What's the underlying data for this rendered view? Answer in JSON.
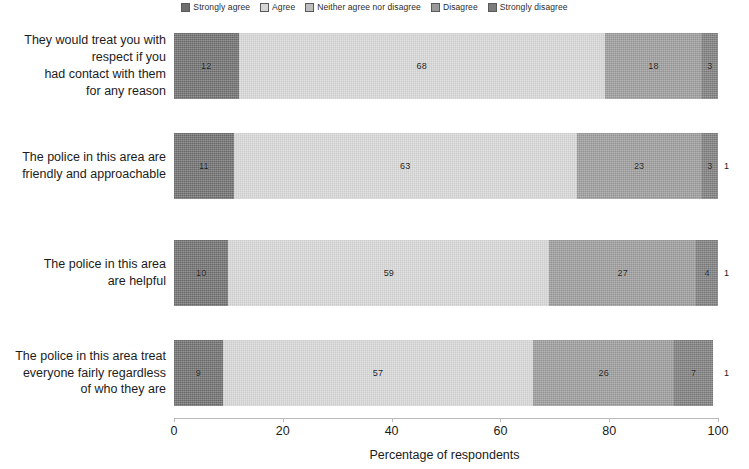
{
  "legend": {
    "position": "top-center",
    "items": [
      {
        "label": "Strongly agree",
        "color": "#6e6e6e"
      },
      {
        "label": "Agree",
        "color": "#d6d6d6"
      },
      {
        "label": "Neither agree nor disagree",
        "color": "#bdbdbd"
      },
      {
        "label": "Disagree",
        "color": "#9a9a9a"
      },
      {
        "label": "Strongly disagree",
        "color": "#7c7c7c"
      }
    ]
  },
  "axis": {
    "x_title": "Percentage of respondents",
    "x_ticks": [
      "0",
      "20",
      "40",
      "60",
      "80",
      "100"
    ]
  },
  "categories": [
    {
      "lines": [
        "They would treat you with",
        "respect if  you",
        "had contact with them",
        "for any reason"
      ]
    },
    {
      "lines": [
        "The police in this area are",
        "friendly and approachable"
      ]
    },
    {
      "lines": [
        "The police in this area",
        "are helpful"
      ]
    },
    {
      "lines": [
        "The police in this area treat",
        "everyone fairly regardless",
        "of who they are"
      ]
    }
  ],
  "chart_data": {
    "type": "bar",
    "orientation": "horizontal",
    "stacked": true,
    "title": "",
    "xlabel": "Percentage of respondents",
    "ylabel": "",
    "xlim": [
      0,
      100
    ],
    "xticks": [
      0,
      20,
      40,
      60,
      80,
      100
    ],
    "grid": false,
    "legend_position": "top-center",
    "categories": [
      "They would treat you with respect if  you had contact with them for any reason",
      "The police in this area are friendly and approachable",
      "The police in this area are helpful",
      "The police in this area treat everyone fairly regardless of who they are"
    ],
    "series": [
      {
        "name": "Strongly agree",
        "color": "#6e6e6e",
        "values": [
          12,
          11,
          10,
          9
        ]
      },
      {
        "name": "Agree",
        "color": "#d6d6d6",
        "values": [
          68,
          63,
          59,
          57
        ]
      },
      {
        "name": "Neither agree nor disagree",
        "color": "#bdbdbd",
        "values": [
          0,
          0,
          0,
          0
        ]
      },
      {
        "name": "Disagree",
        "color": "#9a9a9a",
        "values": [
          18,
          23,
          27,
          26
        ]
      },
      {
        "name": "Strongly disagree",
        "color": "#7c7c7c",
        "values": [
          3,
          3,
          4,
          7
        ]
      }
    ],
    "bars": [
      {
        "category_index": 0,
        "segments": [
          {
            "series": "Strongly agree",
            "value": 12,
            "label": "12",
            "color": "#6e6e6e",
            "label_inside": true
          },
          {
            "series": "Agree",
            "value": 68,
            "label": "68",
            "color": "#d6d6d6",
            "label_inside": true
          },
          {
            "series": "Neither agree nor disagree",
            "value": 0,
            "label": "",
            "color": "#bdbdbd",
            "label_inside": true
          },
          {
            "series": "Disagree",
            "value": 18,
            "label": "18",
            "color": "#9a9a9a",
            "label_inside": true
          },
          {
            "series": "Strongly disagree",
            "value": 3,
            "label": "3",
            "color": "#7c7c7c",
            "label_inside": true
          }
        ],
        "trailing_label": ""
      },
      {
        "category_index": 1,
        "segments": [
          {
            "series": "Strongly agree",
            "value": 11,
            "label": "11",
            "color": "#6e6e6e",
            "label_inside": true
          },
          {
            "series": "Agree",
            "value": 63,
            "label": "63",
            "color": "#d6d6d6",
            "label_inside": true
          },
          {
            "series": "Neither agree nor disagree",
            "value": 0,
            "label": "",
            "color": "#bdbdbd",
            "label_inside": true
          },
          {
            "series": "Disagree",
            "value": 23,
            "label": "23",
            "color": "#9a9a9a",
            "label_inside": true
          },
          {
            "series": "Strongly disagree",
            "value": 3,
            "label": "3",
            "color": "#7c7c7c",
            "label_inside": true
          }
        ],
        "trailing_label": "1"
      },
      {
        "category_index": 2,
        "segments": [
          {
            "series": "Strongly agree",
            "value": 10,
            "label": "10",
            "color": "#6e6e6e",
            "label_inside": true
          },
          {
            "series": "Agree",
            "value": 59,
            "label": "59",
            "color": "#d6d6d6",
            "label_inside": true
          },
          {
            "series": "Neither agree nor disagree",
            "value": 0,
            "label": "",
            "color": "#bdbdbd",
            "label_inside": true
          },
          {
            "series": "Disagree",
            "value": 27,
            "label": "27",
            "color": "#9a9a9a",
            "label_inside": true
          },
          {
            "series": "Strongly disagree",
            "value": 4,
            "label": "4",
            "color": "#7c7c7c",
            "label_inside": true
          }
        ],
        "trailing_label": "1"
      },
      {
        "category_index": 3,
        "segments": [
          {
            "series": "Strongly agree",
            "value": 9,
            "label": "9",
            "color": "#6e6e6e",
            "label_inside": true
          },
          {
            "series": "Agree",
            "value": 57,
            "label": "57",
            "color": "#d6d6d6",
            "label_inside": true
          },
          {
            "series": "Neither agree nor disagree",
            "value": 0,
            "label": "",
            "color": "#bdbdbd",
            "label_inside": true
          },
          {
            "series": "Disagree",
            "value": 26,
            "label": "26",
            "color": "#9a9a9a",
            "label_inside": true
          },
          {
            "series": "Strongly disagree",
            "value": 7,
            "label": "7",
            "color": "#7c7c7c",
            "label_inside": true
          }
        ],
        "trailing_label": "1"
      }
    ]
  },
  "layout": {
    "plot_left_px": 174,
    "plot_width_px": 544,
    "bar_tops_px": [
      33,
      133,
      240,
      340
    ],
    "bar_height_px": 66
  }
}
